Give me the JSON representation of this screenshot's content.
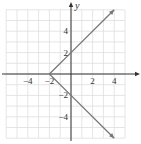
{
  "chart_data": {
    "type": "line",
    "title": "",
    "xlabel": "",
    "ylabel": "y",
    "xlim": [
      -6,
      5
    ],
    "ylim": [
      -6,
      6
    ],
    "grid": true,
    "x_ticks": [
      {
        "value": -4,
        "label": "−4"
      },
      {
        "value": -2,
        "label": "−2"
      },
      {
        "value": 2,
        "label": "2"
      },
      {
        "value": 4,
        "label": "4"
      }
    ],
    "y_ticks": [
      {
        "value": 4,
        "label": "4"
      },
      {
        "value": 2,
        "label": "2"
      },
      {
        "value": -2,
        "label": "−2"
      },
      {
        "value": -4,
        "label": "−4"
      }
    ],
    "series": [
      {
        "name": "upper-branch",
        "x": [
          -2,
          0,
          4
        ],
        "y": [
          0,
          2,
          6
        ],
        "arrow_end": true
      },
      {
        "name": "lower-branch",
        "x": [
          -2,
          0,
          4
        ],
        "y": [
          0,
          -2,
          -6
        ],
        "arrow_end": true
      }
    ],
    "vertex": {
      "x": -2,
      "y": 0
    },
    "annotations": []
  },
  "colors": {
    "grid": "#dedede",
    "axis": "#333333",
    "curve": "#777777",
    "text": "#333333"
  }
}
